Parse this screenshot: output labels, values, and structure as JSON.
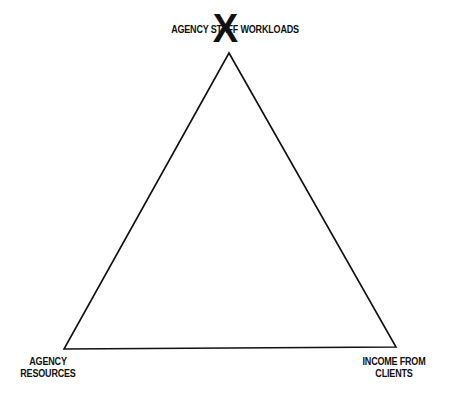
{
  "diagram": {
    "type": "triangle",
    "vertices": {
      "top": {
        "label": "AGENCY STAFF WORKLOADS",
        "visible_label": "AGENCY S   W WORKLOADS",
        "x": 229,
        "y": 53
      },
      "bottom_left": {
        "label_line1": "AGENCY",
        "label_line2": "RESOURCES",
        "x": 64,
        "y": 349
      },
      "bottom_right": {
        "label_line1": "INCOME FROM",
        "label_line2": "CLIENTS",
        "x": 396,
        "y": 347
      }
    },
    "marker": {
      "symbol": "X",
      "position": "top"
    },
    "line_color": "#111111"
  }
}
